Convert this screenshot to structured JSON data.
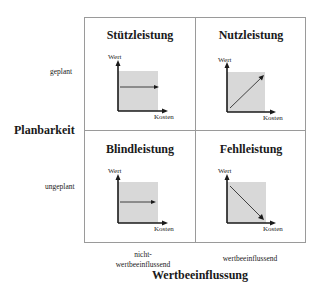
{
  "diagram": {
    "y_axis_title": "Planbarkeit",
    "x_axis_title": "Wertbeeinflussung",
    "rows": [
      {
        "label": "geplant"
      },
      {
        "label": "ungeplant"
      }
    ],
    "columns": [
      {
        "label": "nicht-\nwertbeeinflussend"
      },
      {
        "label": "wertbeeinflussend"
      }
    ],
    "quadrants": [
      {
        "title": "Stützleistung",
        "row": "geplant",
        "column": "nicht-wertbeeinflussend",
        "trend": "flat",
        "y_label": "Wert",
        "x_label": "Kosten"
      },
      {
        "title": "Nutzleistung",
        "row": "geplant",
        "column": "wertbeeinflussend",
        "trend": "increasing",
        "y_label": "Wert",
        "x_label": "Kosten"
      },
      {
        "title": "Blindleistung",
        "row": "ungeplant",
        "column": "nicht-wertbeeinflussend",
        "trend": "flat",
        "y_label": "Wert",
        "x_label": "Kosten"
      },
      {
        "title": "Fehlleistung",
        "row": "ungeplant",
        "column": "wertbeeinflussend",
        "trend": "decreasing",
        "y_label": "Wert",
        "x_label": "Kosten"
      }
    ],
    "colors": {
      "grid_line": "#9a9a9a",
      "shade": "#d8d8d8",
      "axis": "#1a1a1a"
    }
  }
}
